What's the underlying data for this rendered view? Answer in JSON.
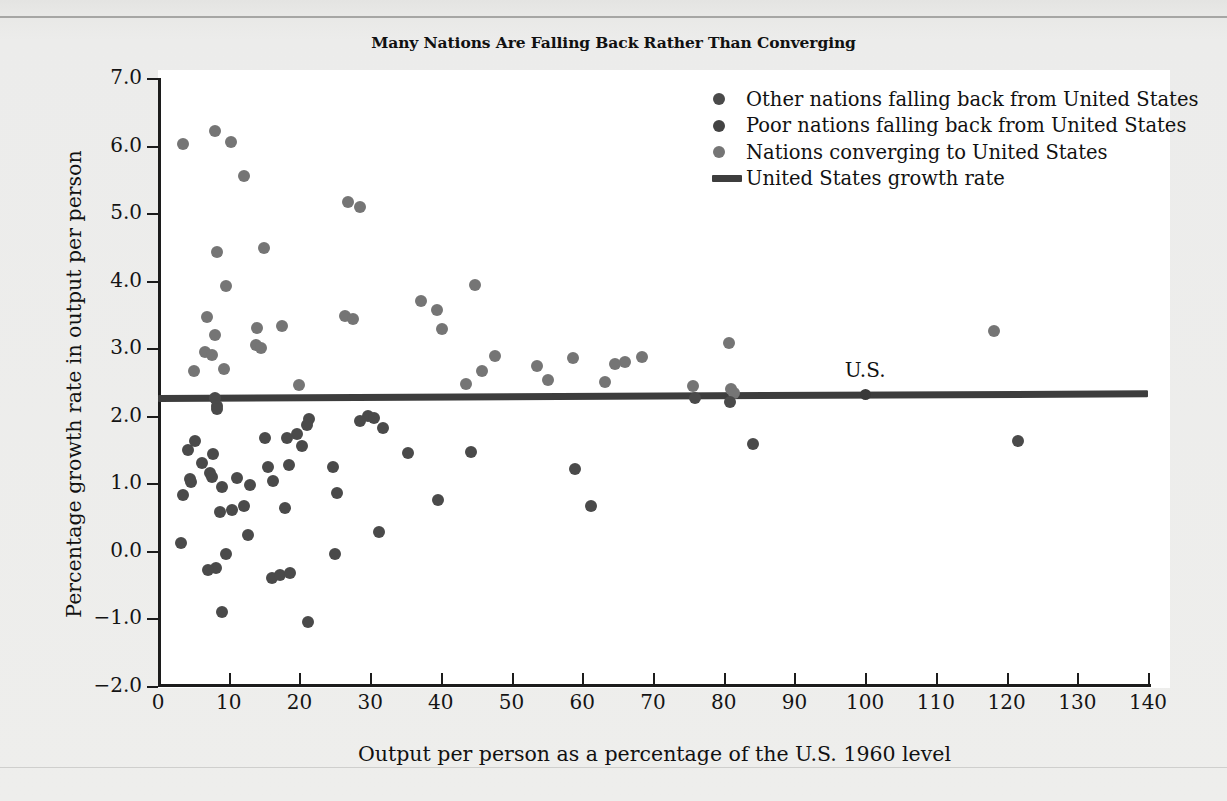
{
  "figure": {
    "title": "Many Nations Are Falling Back Rather Than Converging",
    "annotation_label": "U.S."
  },
  "legend": {
    "items": [
      {
        "label": "Other nations falling back from United States",
        "marker": "dot",
        "color": "#4a4a4a",
        "key": "other"
      },
      {
        "label": "Poor nations falling back from United States",
        "marker": "dot",
        "color": "#434343",
        "key": "poor"
      },
      {
        "label": "Nations converging to United States",
        "marker": "dot",
        "color": "#757575",
        "key": "conv"
      },
      {
        "label": "United States growth rate",
        "marker": "line",
        "color": "#3d3d3d",
        "key": "usline"
      }
    ]
  },
  "chart_data": {
    "type": "scatter",
    "title": "Many Nations Are Falling Back Rather Than Converging",
    "xlabel": "Output per person as a percentage of the U.S. 1960 level",
    "ylabel": "Percentage growth rate in output per person",
    "xlim": [
      0,
      140
    ],
    "ylim": [
      -2.0,
      7.0
    ],
    "xticks": [
      0,
      10,
      20,
      30,
      40,
      50,
      60,
      70,
      80,
      90,
      100,
      110,
      120,
      130,
      140
    ],
    "yticks": [
      -2.0,
      -1.0,
      0.0,
      1.0,
      2.0,
      3.0,
      4.0,
      5.0,
      6.0,
      7.0
    ],
    "ytick_labels": [
      "−2.0",
      "−1.0",
      "0.0",
      "1.0",
      "2.0",
      "3.0",
      "4.0",
      "5.0",
      "6.0",
      "7.0"
    ],
    "grid": false,
    "legend_position": "top-right",
    "reference_line": {
      "name": "United States growth rate",
      "y_start": 2.26,
      "y_end": 2.33,
      "color": "#3d3d3d"
    },
    "annotations": [
      {
        "text": "U.S.",
        "x": 100,
        "y": 2.32
      }
    ],
    "series": [
      {
        "name": "Nations converging to United States",
        "color": "#757575",
        "points": [
          [
            3.6,
            6.02
          ],
          [
            8.0,
            6.22
          ],
          [
            10.3,
            6.05
          ],
          [
            12.2,
            5.55
          ],
          [
            26.8,
            5.16
          ],
          [
            28.6,
            5.09
          ],
          [
            44.8,
            3.94
          ],
          [
            37.2,
            3.7
          ],
          [
            39.5,
            3.56
          ],
          [
            26.5,
            3.47
          ],
          [
            27.6,
            3.43
          ],
          [
            40.2,
            3.29
          ],
          [
            8.4,
            4.42
          ],
          [
            15.0,
            4.48
          ],
          [
            9.6,
            3.92
          ],
          [
            6.9,
            3.46
          ],
          [
            14.0,
            3.3
          ],
          [
            17.5,
            3.33
          ],
          [
            8.1,
            3.2
          ],
          [
            13.8,
            3.05
          ],
          [
            14.6,
            3.01
          ],
          [
            80.8,
            3.07
          ],
          [
            6.6,
            2.95
          ],
          [
            7.6,
            2.9
          ],
          [
            9.4,
            2.69
          ],
          [
            5.1,
            2.66
          ],
          [
            47.6,
            2.88
          ],
          [
            58.7,
            2.86
          ],
          [
            68.5,
            2.87
          ],
          [
            66.0,
            2.8
          ],
          [
            64.6,
            2.76
          ],
          [
            53.6,
            2.74
          ],
          [
            45.8,
            2.66
          ],
          [
            55.2,
            2.53
          ],
          [
            63.2,
            2.5
          ],
          [
            43.5,
            2.47
          ],
          [
            19.9,
            2.46
          ],
          [
            75.6,
            2.44
          ],
          [
            81.0,
            2.4
          ],
          [
            81.4,
            2.34
          ],
          [
            118.2,
            3.26
          ]
        ]
      },
      {
        "name": "Other nations falling back from United States",
        "color": "#4a4a4a",
        "points": [
          [
            8.0,
            2.26
          ],
          [
            8.3,
            2.14
          ],
          [
            8.4,
            2.1
          ],
          [
            21.4,
            1.95
          ],
          [
            29.7,
            2.0
          ],
          [
            30.6,
            1.96
          ],
          [
            21.0,
            1.86
          ],
          [
            31.8,
            1.82
          ],
          [
            28.6,
            1.93
          ],
          [
            19.7,
            1.73
          ],
          [
            15.2,
            1.67
          ],
          [
            18.2,
            1.67
          ],
          [
            20.4,
            1.55
          ],
          [
            35.4,
            1.45
          ],
          [
            44.2,
            1.47
          ],
          [
            5.2,
            1.62
          ],
          [
            4.3,
            1.49
          ],
          [
            7.8,
            1.44
          ],
          [
            75.9,
            2.26
          ],
          [
            80.9,
            2.21
          ],
          [
            100.0,
            2.32
          ],
          [
            84.1,
            1.58
          ],
          [
            121.6,
            1.62
          ],
          [
            59.0,
            1.21
          ],
          [
            18.5,
            1.27
          ],
          [
            24.7,
            1.24
          ],
          [
            6.2,
            1.3
          ],
          [
            7.4,
            1.15
          ],
          [
            7.6,
            1.1
          ],
          [
            11.2,
            1.08
          ],
          [
            16.3,
            1.04
          ],
          [
            15.5,
            1.24
          ],
          [
            4.5,
            1.06
          ],
          [
            4.7,
            1.02
          ],
          [
            9.1,
            0.95
          ],
          [
            13.0,
            0.97
          ],
          [
            12.1,
            0.66
          ],
          [
            10.4,
            0.61
          ],
          [
            8.8,
            0.58
          ],
          [
            17.9,
            0.64
          ],
          [
            25.3,
            0.85
          ],
          [
            39.6,
            0.75
          ],
          [
            61.2,
            0.66
          ],
          [
            31.2,
            0.28
          ],
          [
            12.7,
            0.24
          ],
          [
            25.0,
            -0.04
          ],
          [
            9.6,
            -0.05
          ],
          [
            3.6,
            0.82
          ],
          [
            3.3,
            0.12
          ],
          [
            8.2,
            -0.26
          ],
          [
            7.0,
            -0.29
          ],
          [
            16.1,
            -0.4
          ],
          [
            17.3,
            -0.36
          ],
          [
            18.6,
            -0.32
          ],
          [
            9.0,
            -0.91
          ],
          [
            21.2,
            -1.06
          ]
        ]
      }
    ]
  }
}
